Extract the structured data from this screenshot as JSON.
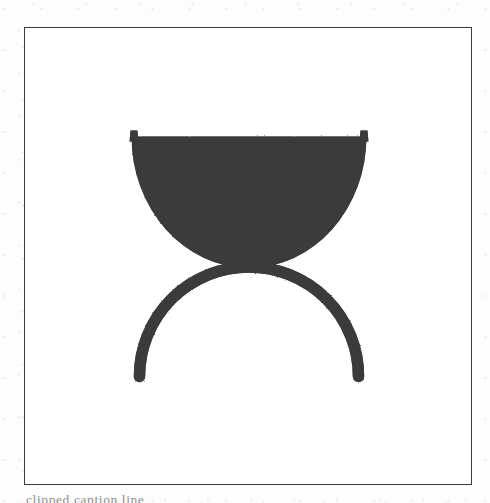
{
  "page": {
    "kind": "scanned-figure-plate",
    "background_color": "#fdfdfd"
  },
  "plate": {
    "border_color": "#3b3b3b",
    "background_color": "#ffffff",
    "ink_color": "#3a3a3a"
  },
  "artwork": {
    "title": "bowl-over-arch-symbol",
    "description": "Solid dark semicircular bowl with small upturned tips at both rim corners, resting above an inverted-U arch with rounded terminals.",
    "elements": [
      {
        "name": "bowl",
        "shape": "filled-semicircle",
        "fill": "#3a3a3a",
        "rim_left_x": 131,
        "rim_right_x": 367,
        "rim_y": 136,
        "bottom_y": 268
      },
      {
        "name": "rim-tip-left",
        "shape": "small-upward-spur",
        "x": 133,
        "y": 130
      },
      {
        "name": "rim-tip-right",
        "shape": "small-upward-spur",
        "x": 365,
        "y": 130
      },
      {
        "name": "arch",
        "shape": "inverted-u-stroke",
        "stroke": "#3a3a3a",
        "stroke_width": 11,
        "apex_y": 264,
        "left_foot_x": 139,
        "right_foot_x": 359,
        "foot_y": 377
      }
    ]
  },
  "caption": {
    "text": "clipped caption line",
    "visible": "partially-clipped"
  }
}
